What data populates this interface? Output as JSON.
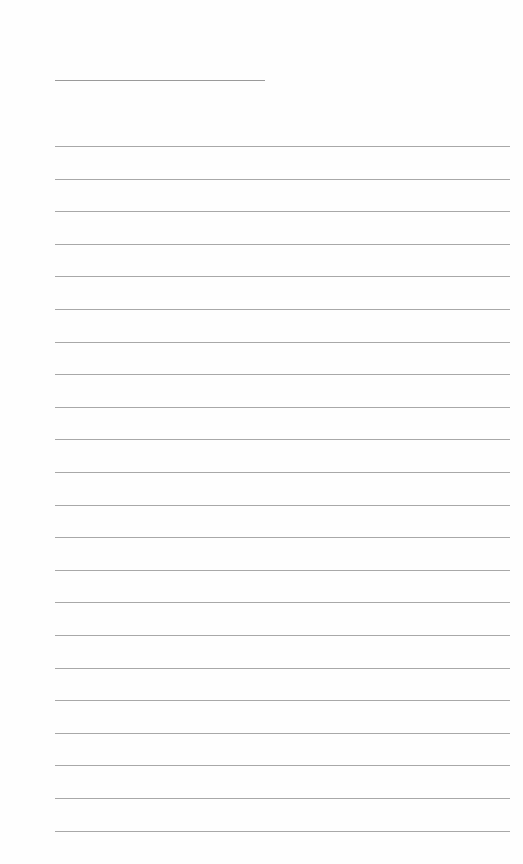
{
  "document": {
    "type": "blank lined sheet",
    "title_line": {
      "filled_text": "",
      "width_px": 210
    },
    "ruled_lines": {
      "count": 22,
      "spacing_px": 32.6,
      "line_color": "#a8a8a8",
      "filled_text": [
        "",
        "",
        "",
        "",
        "",
        "",
        "",
        "",
        "",
        "",
        "",
        "",
        "",
        "",
        "",
        "",
        "",
        "",
        "",
        "",
        "",
        ""
      ]
    },
    "background_color": "#fefefe"
  }
}
